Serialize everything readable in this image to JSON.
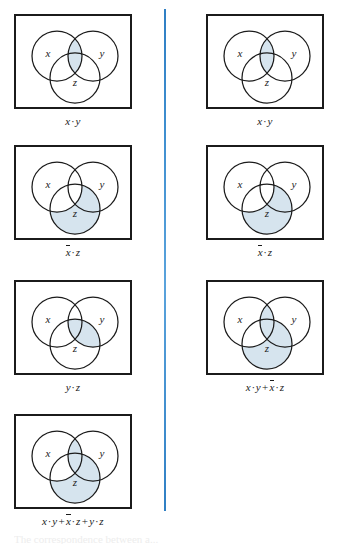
{
  "figure": {
    "type": "venn-diagram-grid",
    "columns": 2,
    "divider_color": "#3f8fd0",
    "shade_color": "#d6e4ee",
    "stroke_color": "#1b1b1b",
    "set_labels": [
      "x",
      "y",
      "z"
    ],
    "cutoff_text": "The correspondence between a..."
  },
  "panels": [
    {
      "id": "p1",
      "column": "left",
      "row": 1,
      "caption": {
        "parts": [
          "x",
          "·",
          "y"
        ],
        "text": "x · y"
      },
      "labels": {
        "x": "x",
        "y": "y",
        "z": "z"
      },
      "shaded_regions": [
        "x∩y"
      ]
    },
    {
      "id": "p2",
      "column": "right",
      "row": 1,
      "caption": {
        "parts": [
          "x",
          "·",
          "y"
        ],
        "text": "x · y"
      },
      "labels": {
        "x": "x",
        "y": "y",
        "z": "z"
      },
      "shaded_regions": [
        "x∩y"
      ]
    },
    {
      "id": "p3",
      "column": "left",
      "row": 2,
      "caption": {
        "parts": [
          "x̄",
          "·",
          "z"
        ],
        "text": "x̄ · z"
      },
      "labels": {
        "x": "x",
        "y": "y",
        "z": "z"
      },
      "shaded_regions": [
        "z∖x"
      ]
    },
    {
      "id": "p4",
      "column": "right",
      "row": 2,
      "caption": {
        "parts": [
          "x̄",
          "·",
          "z"
        ],
        "text": "x̄ · z"
      },
      "labels": {
        "x": "x",
        "y": "y",
        "z": "z"
      },
      "shaded_regions": [
        "z∖x"
      ]
    },
    {
      "id": "p5",
      "column": "left",
      "row": 3,
      "caption": {
        "parts": [
          "y",
          "·",
          "z"
        ],
        "text": "y · z"
      },
      "labels": {
        "x": "x",
        "y": "y",
        "z": "z"
      },
      "shaded_regions": [
        "y∩z"
      ]
    },
    {
      "id": "p6",
      "column": "right",
      "row": 3,
      "caption": {
        "parts": [
          "x",
          "·",
          "y",
          "+",
          "x̄",
          "·",
          "z"
        ],
        "text": "x · y + x̄ · z"
      },
      "labels": {
        "x": "x",
        "y": "y",
        "z": "z"
      },
      "shaded_regions": [
        "x∩y",
        "z∖x"
      ]
    },
    {
      "id": "p7",
      "column": "left",
      "row": 4,
      "caption": {
        "parts": [
          "x",
          "·",
          "y",
          "+",
          "x̄",
          "·",
          "z",
          "+",
          "y",
          "·",
          "z"
        ],
        "text": "x · y + x̄ · z + y · z"
      },
      "labels": {
        "x": "x",
        "y": "y",
        "z": "z"
      },
      "shaded_regions": [
        "x∩y",
        "z∖x",
        "y∩z"
      ]
    }
  ]
}
